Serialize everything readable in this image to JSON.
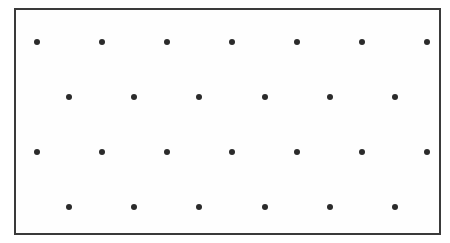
{
  "figure": {
    "canvas_width": 450,
    "canvas_height": 243,
    "background_color": "#ffffff"
  },
  "frame": {
    "label": "rectangular-border",
    "x": 14,
    "y": 8,
    "width": 427,
    "height": 227,
    "border_width": 2,
    "border_color": "#3a3a3a",
    "fill_color": "#fefefe"
  },
  "lattice": {
    "label": "hexagonal staggered dot array",
    "dot_color": "#2b2b2b",
    "dot_diameter": 6,
    "row_count": 4,
    "total_dots": 26,
    "column_pitch_x": 65,
    "row_pitch_y": 55,
    "stagger_offset_x": 32.5,
    "rows": [
      {
        "index": 1,
        "dot_count": 7,
        "y": 42,
        "offset": "aligned",
        "x_positions": [
          37,
          102,
          167,
          232,
          297,
          362,
          427
        ]
      },
      {
        "index": 2,
        "dot_count": 6,
        "y": 97,
        "offset": "staggered",
        "x_positions": [
          69,
          134,
          199,
          265,
          330,
          395
        ]
      },
      {
        "index": 3,
        "dot_count": 7,
        "y": 152,
        "offset": "aligned",
        "x_positions": [
          37,
          102,
          167,
          232,
          297,
          362,
          427
        ]
      },
      {
        "index": 4,
        "dot_count": 6,
        "y": 207,
        "offset": "staggered",
        "x_positions": [
          69,
          134,
          199,
          265,
          330,
          395
        ]
      }
    ]
  }
}
